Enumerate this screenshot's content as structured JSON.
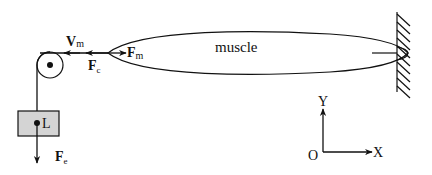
{
  "diagram": {
    "labels": {
      "muscle": "muscle",
      "velocity_main": "V",
      "velocity_sub": "m",
      "force_muscle_main": "F",
      "force_muscle_sub": "m",
      "force_cable_main": "F",
      "force_cable_sub": "c",
      "force_load_main": "F",
      "force_load_sub": "e",
      "load": "L",
      "axis_y": "Y",
      "axis_x": "X",
      "origin": "O"
    },
    "colors": {
      "stroke": "#111111",
      "load_fill": "#d4d4d4"
    }
  }
}
